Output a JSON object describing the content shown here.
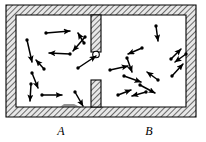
{
  "figure": {
    "background_color": "#ffffff",
    "wall_color": "#000000",
    "hatch_color": "#555555",
    "arrow_color": "#000000",
    "width": 206,
    "height": 142
  },
  "labels": [
    {
      "name": "chamber-a-label",
      "text": "A",
      "x": 51,
      "y": 124
    },
    {
      "name": "chamber-b-label",
      "text": "B",
      "x": 139,
      "y": 124
    }
  ],
  "container": {
    "outer": {
      "x": 6,
      "y": 5,
      "w": 190,
      "h": 112
    },
    "wall_thickness": 10,
    "partition_top": {
      "x": 91,
      "y": 15,
      "w": 10,
      "h": 37
    },
    "partition_bottom": {
      "x": 91,
      "y": 80,
      "w": 10,
      "h": 27
    },
    "aperture_valve": {
      "cx": 96,
      "cy": 54,
      "r": 3.2
    }
  },
  "chambers": {
    "a": {
      "x": 16,
      "y": 15,
      "w": 75,
      "h": 92,
      "label": "A"
    },
    "b": {
      "x": 101,
      "y": 15,
      "w": 85,
      "h": 92,
      "label": "B"
    }
  },
  "chart_data": {
    "type": "scatter",
    "xlabel": "",
    "ylabel": "",
    "series": [
      {
        "name": "chamber-A-molecules",
        "description": "Velocity vectors (arrows) of molecules in chamber A",
        "count": 11,
        "vectors": [
          {
            "x1": 46,
            "y1": 33,
            "x2": 70,
            "y2": 31
          },
          {
            "x1": 27,
            "y1": 40,
            "x2": 32,
            "y2": 62
          },
          {
            "x1": 85,
            "y1": 37,
            "x2": 73,
            "y2": 51
          },
          {
            "x1": 70,
            "y1": 54,
            "x2": 49,
            "y2": 53
          },
          {
            "x1": 44,
            "y1": 69,
            "x2": 36,
            "y2": 60
          },
          {
            "x1": 32,
            "y1": 73,
            "x2": 38,
            "y2": 88
          },
          {
            "x1": 31,
            "y1": 84,
            "x2": 30,
            "y2": 101
          },
          {
            "x1": 42,
            "y1": 95,
            "x2": 62,
            "y2": 95
          },
          {
            "x1": 75,
            "y1": 92,
            "x2": 83,
            "y2": 106
          },
          {
            "x1": 78,
            "y1": 68,
            "x2": 96,
            "y2": 56
          },
          {
            "x1": 84,
            "y1": 43,
            "x2": 78,
            "y2": 33
          }
        ]
      },
      {
        "name": "chamber-B-molecules",
        "description": "Velocity vectors (arrows) of molecules in chamber B",
        "count": 12,
        "vectors": [
          {
            "x1": 156,
            "y1": 26,
            "x2": 158,
            "y2": 41
          },
          {
            "x1": 142,
            "y1": 48,
            "x2": 128,
            "y2": 54
          },
          {
            "x1": 127,
            "y1": 58,
            "x2": 132,
            "y2": 72
          },
          {
            "x1": 171,
            "y1": 59,
            "x2": 181,
            "y2": 49
          },
          {
            "x1": 186,
            "y1": 54,
            "x2": 175,
            "y2": 62
          },
          {
            "x1": 110,
            "y1": 70,
            "x2": 128,
            "y2": 66
          },
          {
            "x1": 124,
            "y1": 76,
            "x2": 141,
            "y2": 82
          },
          {
            "x1": 158,
            "y1": 80,
            "x2": 147,
            "y2": 72
          },
          {
            "x1": 172,
            "y1": 76,
            "x2": 183,
            "y2": 64
          },
          {
            "x1": 118,
            "y1": 95,
            "x2": 131,
            "y2": 90
          },
          {
            "x1": 146,
            "y1": 92,
            "x2": 132,
            "y2": 96
          },
          {
            "x1": 140,
            "y1": 85,
            "x2": 155,
            "y2": 93
          }
        ]
      }
    ]
  }
}
